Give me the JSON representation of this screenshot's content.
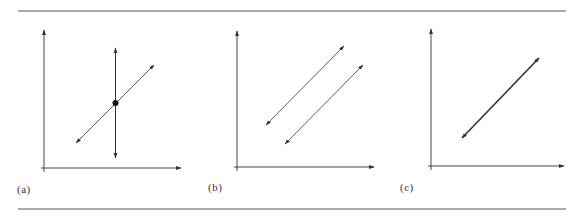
{
  "figure": {
    "rules": {
      "top_y": 11,
      "bottom_y": 209,
      "x_start": 18,
      "x_end": 566
    },
    "stroke_color": "#333333",
    "panels": [
      {
        "id": "a",
        "label": "(a)",
        "label_pos": {
          "x": 17,
          "y": 183
        },
        "axes": {
          "origin": [
            44,
            168
          ],
          "y_top": 30,
          "x_right": 181
        },
        "lines": [
          {
            "name": "vertical-line",
            "x1": 115.5,
            "y1": 48,
            "x2": 115.5,
            "y2": 158,
            "width": 1
          },
          {
            "name": "diagonal-line",
            "x1": 76,
            "y1": 143,
            "x2": 154,
            "y2": 65,
            "width": 0.8
          }
        ],
        "points": [
          {
            "name": "intersection-point",
            "x": 115.5,
            "y": 103,
            "r": 3
          }
        ]
      },
      {
        "id": "b",
        "label": "(b)",
        "label_pos": {
          "x": 208,
          "y": 181
        },
        "axes": {
          "origin": [
            237,
            167
          ],
          "y_top": 31,
          "x_right": 374
        },
        "lines": [
          {
            "name": "parallel-line-1",
            "x1": 266,
            "y1": 125,
            "x2": 344,
            "y2": 46,
            "width": 0.8
          },
          {
            "name": "parallel-line-2",
            "x1": 285,
            "y1": 144,
            "x2": 363,
            "y2": 65,
            "width": 0.8
          }
        ],
        "points": []
      },
      {
        "id": "c",
        "label": "(c)",
        "label_pos": {
          "x": 400,
          "y": 181
        },
        "axes": {
          "origin": [
            431,
            166
          ],
          "y_top": 29,
          "x_right": 564
        },
        "lines": [
          {
            "name": "coincident-line",
            "x1": 462,
            "y1": 138,
            "x2": 539,
            "y2": 58,
            "width": 1.6
          }
        ],
        "points": []
      }
    ]
  }
}
